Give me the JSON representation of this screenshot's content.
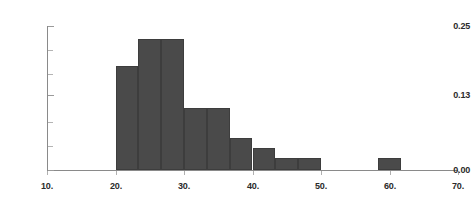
{
  "chart_data": {
    "type": "bar",
    "title": "",
    "subtitle": "",
    "xlabel": "",
    "ylabel": "",
    "xlim": [
      10,
      70
    ],
    "ylim": [
      0.0,
      0.25
    ],
    "grid": false,
    "legend": null,
    "bar_color": "#4a4a4a",
    "axis_color": "#8a8a8a",
    "bin_width": 3.33,
    "x_ticks": [
      {
        "value": 10,
        "label": "10."
      },
      {
        "value": 20,
        "label": "20."
      },
      {
        "value": 30,
        "label": "30."
      },
      {
        "value": 40,
        "label": "40."
      },
      {
        "value": 50,
        "label": "50."
      },
      {
        "value": 60,
        "label": "60."
      },
      {
        "value": 70,
        "label": "70."
      }
    ],
    "y_ticks": [
      {
        "value": 0.25,
        "label": "0.25",
        "major": true
      },
      {
        "value": 0.2083,
        "label": "",
        "major": false
      },
      {
        "value": 0.1667,
        "label": "",
        "major": false
      },
      {
        "value": 0.13,
        "label": "0.13",
        "major": true
      },
      {
        "value": 0.0833,
        "label": "",
        "major": false
      },
      {
        "value": 0.0417,
        "label": "",
        "major": false
      },
      {
        "value": 0.0,
        "label": "0.00",
        "major": true
      }
    ],
    "bins": [
      {
        "x0": 20.0,
        "x1": 23.33,
        "value": 0.18
      },
      {
        "x0": 23.33,
        "x1": 26.67,
        "value": 0.228
      },
      {
        "x0": 26.67,
        "x1": 30.0,
        "value": 0.228
      },
      {
        "x0": 30.0,
        "x1": 33.33,
        "value": 0.108
      },
      {
        "x0": 33.33,
        "x1": 36.67,
        "value": 0.108
      },
      {
        "x0": 36.67,
        "x1": 40.0,
        "value": 0.056
      },
      {
        "x0": 40.0,
        "x1": 43.33,
        "value": 0.038
      },
      {
        "x0": 43.33,
        "x1": 46.67,
        "value": 0.02
      },
      {
        "x0": 46.67,
        "x1": 50.0,
        "value": 0.02
      },
      {
        "x0": 58.33,
        "x1": 61.67,
        "value": 0.02
      }
    ],
    "categories": [
      "20-23.3",
      "23.3-26.7",
      "26.7-30",
      "30-33.3",
      "33.3-36.7",
      "36.7-40",
      "40-43.3",
      "43.3-46.7",
      "46.7-50",
      "58.3-61.7"
    ],
    "values": [
      0.18,
      0.228,
      0.228,
      0.108,
      0.108,
      0.056,
      0.038,
      0.02,
      0.02,
      0.02
    ]
  }
}
